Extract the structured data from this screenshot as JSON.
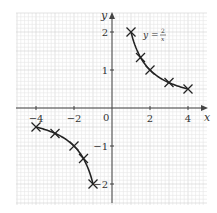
{
  "chart_data": {
    "type": "line",
    "title": "",
    "function_label": "y = 2/x",
    "function_label_parts": {
      "lhs": "y =",
      "numerator": "2",
      "denominator": "x"
    },
    "xlabel": "x",
    "ylabel": "y",
    "xlim": [
      -5,
      5
    ],
    "ylim": [
      -2.5,
      2.5
    ],
    "grid": true,
    "x_ticks": [
      -4,
      -2,
      2,
      4
    ],
    "x_tick_labels": [
      "−4",
      "−2",
      "2",
      "4"
    ],
    "y_ticks": [
      2,
      1,
      -1,
      -2
    ],
    "y_tick_labels": [
      "2",
      "1",
      "−1",
      "−2"
    ],
    "origin_label": "0",
    "series": [
      {
        "name": "y = 2/x (positive branch)",
        "marker": "cross",
        "points": [
          [
            1,
            2
          ],
          [
            1.5,
            1.33
          ],
          [
            2,
            1
          ],
          [
            3,
            0.67
          ],
          [
            4,
            0.5
          ]
        ]
      },
      {
        "name": "y = 2/x (negative branch)",
        "marker": "cross",
        "points": [
          [
            -4,
            -0.5
          ],
          [
            -3,
            -0.67
          ],
          [
            -2,
            -1
          ],
          [
            -1.5,
            -1.33
          ],
          [
            -1,
            -2
          ]
        ]
      }
    ],
    "colors": {
      "curve": "#222222",
      "axis": "#444444",
      "grid_minor": "#e6e6e6",
      "grid_major": "#d0d0d0"
    }
  }
}
